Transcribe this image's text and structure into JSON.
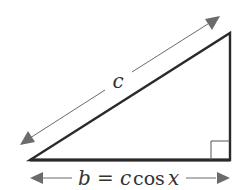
{
  "diagram": {
    "type": "right-triangle",
    "hypotenuse": {
      "label": "c"
    },
    "base": {
      "label_var": "b",
      "label_eq": "=",
      "label_c": "c",
      "label_func": "cos",
      "label_x": "x",
      "full_label": "b = c cos x"
    },
    "right_angle_marker": true,
    "colors": {
      "triangle_stroke": "#2a2a2a",
      "arrow": "#6b6b6b",
      "text": "#333333",
      "background": "#ffffff"
    }
  }
}
